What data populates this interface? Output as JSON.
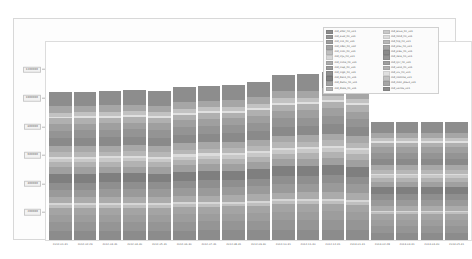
{
  "chart_data": {
    "type": "bar",
    "stacked": true,
    "title": "",
    "xlabel": "",
    "ylabel": "",
    "ylim": [
      0,
      1400000
    ],
    "grid": false,
    "legend_position": "upper right",
    "yticks": [
      200000,
      400000,
      600000,
      800000,
      1000000,
      1200000
    ],
    "ytick_labels": [
      "200000",
      "400000",
      "600000",
      "800000",
      "1000000",
      "1200000"
    ],
    "categories": [
      "2012-01-31",
      "2012-02-29",
      "2012-03-31",
      "2012-04-30",
      "2012-05-31",
      "2012-06-30",
      "2012-07-31",
      "2012-08-31",
      "2012-09-30",
      "2012-10-31",
      "2012-11-30",
      "2012-12-31",
      "2013-01-31",
      "2013-02-28",
      "2013-03-31",
      "2013-04-30",
      "2013-05-31"
    ],
    "totals": [
      1048000,
      1050000,
      1055000,
      1060000,
      1052000,
      1080000,
      1092000,
      1098000,
      1120000,
      1165000,
      1172000,
      1188000,
      1160000,
      838000,
      838000,
      838000,
      838000
    ],
    "series": [
      {
        "name": "md_ahor_fin_v01",
        "color": "#8c8c8c"
      },
      {
        "name": "md_aval_fin_v01",
        "color": "#959595"
      },
      {
        "name": "md_cco_fin_v01",
        "color": "#9d9d9d"
      },
      {
        "name": "md_cdat_fin_v02",
        "color": "#a4a4a4"
      },
      {
        "name": "md_ccot_fin_v01",
        "color": "#bfbfbf"
      },
      {
        "name": "md_clju_fin_v01",
        "color": "#d6d6d6"
      },
      {
        "name": "md_ctma_fin_v01",
        "color": "#ababab"
      },
      {
        "name": "md_ctsp_fin_v01",
        "color": "#9a9a9a"
      },
      {
        "name": "md_ctgo_fin_v01",
        "color": "#8f8f8f"
      },
      {
        "name": "md_daco_fin_v01",
        "color": "#7f7f7f"
      },
      {
        "name": "md_dsmv_fin_v01",
        "color": "#a0a0a0"
      },
      {
        "name": "md_diala_fin_v01",
        "color": "#b2b2b2"
      },
      {
        "name": "md_ecua_fin_v01",
        "color": "#c8c8c8"
      },
      {
        "name": "md_fond_fin_v01",
        "color": "#dcdcdc"
      },
      {
        "name": "md_hip_fin_v01",
        "color": "#b7b7b7"
      },
      {
        "name": "md_plaz_fin_v01",
        "color": "#a8a8a8"
      },
      {
        "name": "md_prev_fin_v01",
        "color": "#8a8a8a"
      },
      {
        "name": "md_reca_fin_v01",
        "color": "#949494"
      },
      {
        "name": "md_tjcr_fin_v01",
        "color": "#9f9f9f"
      },
      {
        "name": "md_vato_fin_v01",
        "color": "#b0b0b0"
      },
      {
        "name": "md_viv_fin_v01",
        "color": "#e0e0e0"
      },
      {
        "name": "md_nomina_v01",
        "color": "#c2c2c2"
      },
      {
        "name": "md_mon_plazo_v01",
        "color": "#a6a6a6"
      },
      {
        "name": "md_varios_v01",
        "color": "#8d8d8d"
      }
    ],
    "segment_fractions": [
      0.062,
      0.058,
      0.05,
      0.046,
      0.018,
      0.013,
      0.041,
      0.052,
      0.047,
      0.06,
      0.044,
      0.034,
      0.022,
      0.014,
      0.032,
      0.04,
      0.056,
      0.05,
      0.045,
      0.038,
      0.012,
      0.026,
      0.043,
      0.097
    ]
  }
}
